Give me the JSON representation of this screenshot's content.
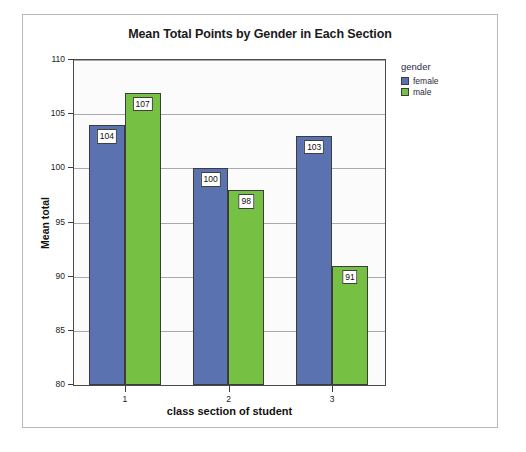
{
  "chart_data": {
    "type": "bar",
    "title": "Mean Total Points by Gender in Each Section",
    "xlabel": "class section of student",
    "ylabel": "Mean total",
    "categories": [
      "1",
      "2",
      "3"
    ],
    "series": [
      {
        "name": "female",
        "color": "#5a72b0",
        "values": [
          104,
          100,
          103
        ]
      },
      {
        "name": "male",
        "color": "#76c043",
        "values": [
          107,
          98,
          91
        ]
      }
    ],
    "ylim": [
      80,
      110
    ],
    "yticks": [
      80,
      85,
      90,
      95,
      100,
      105,
      110
    ],
    "ytick_labels": [
      "80",
      "85",
      "90",
      "95",
      "100",
      "105",
      "110"
    ],
    "grid": true,
    "legend": {
      "title": "gender",
      "position": "right",
      "entries": [
        {
          "label": "female",
          "color": "#5a72b0"
        },
        {
          "label": "male",
          "color": "#76c043"
        }
      ]
    },
    "data_labels": [
      {
        "group": "1",
        "series": "female",
        "text": "104"
      },
      {
        "group": "1",
        "series": "male",
        "text": "107"
      },
      {
        "group": "2",
        "series": "female",
        "text": "100"
      },
      {
        "group": "2",
        "series": "male",
        "text": "98"
      },
      {
        "group": "3",
        "series": "female",
        "text": "103"
      },
      {
        "group": "3",
        "series": "male",
        "text": "91"
      }
    ]
  }
}
